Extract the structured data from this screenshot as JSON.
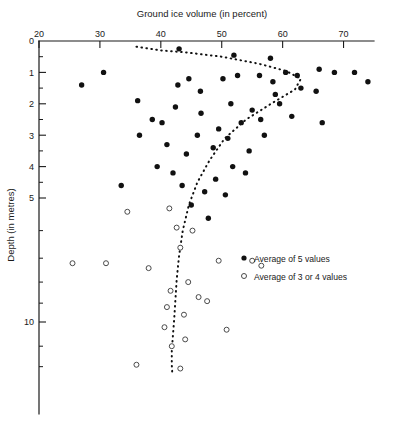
{
  "chart_data": {
    "type": "scatter",
    "title": "Ground ice volume (in percent)",
    "xlabel": "Ground ice volume (in percent)",
    "ylabel": "Depth (in metres)",
    "xlim": [
      20,
      75
    ],
    "ylim": [
      0,
      16
    ],
    "yscale": "log-like-depth",
    "grid": false,
    "xticks": [
      20,
      30,
      40,
      50,
      60,
      70
    ],
    "xtick_labels": [
      "20",
      "30",
      "40",
      "50",
      "60",
      "70"
    ],
    "yticks": [
      0,
      1,
      2,
      3,
      4,
      5,
      10
    ],
    "ytick_labels": [
      "0",
      "1",
      "2",
      "3",
      "4",
      "5",
      "10"
    ],
    "yticks_minor": [
      0.5,
      1.5,
      2.5,
      3.5,
      4.5,
      6,
      7,
      8,
      9,
      12,
      14
    ],
    "legend_position": "center-right",
    "series": [
      {
        "name": "Average of 5 values",
        "marker": "filled-circle",
        "color": "#111111",
        "points": [
          [
            27.0,
            1.4
          ],
          [
            30.6,
            1.0
          ],
          [
            36.2,
            1.9
          ],
          [
            38.6,
            2.5
          ],
          [
            36.5,
            3.0
          ],
          [
            42.8,
            1.4
          ],
          [
            46.5,
            1.6
          ],
          [
            46.6,
            2.3
          ],
          [
            46.0,
            3.0
          ],
          [
            44.2,
            3.6
          ],
          [
            42.0,
            4.2
          ],
          [
            33.5,
            4.6
          ],
          [
            50.2,
            1.2
          ],
          [
            51.5,
            2.0
          ],
          [
            52.6,
            1.1
          ],
          [
            56.2,
            1.1
          ],
          [
            58.4,
            1.3
          ],
          [
            58.8,
            1.7
          ],
          [
            55.0,
            2.2
          ],
          [
            53.2,
            2.6
          ],
          [
            56.4,
            2.5
          ],
          [
            51.0,
            3.1
          ],
          [
            48.6,
            3.4
          ],
          [
            54.5,
            3.5
          ],
          [
            51.8,
            4.0
          ],
          [
            49.0,
            4.4
          ],
          [
            47.2,
            4.8
          ],
          [
            50.6,
            4.9
          ],
          [
            60.5,
            1.0
          ],
          [
            62.4,
            1.1
          ],
          [
            66.0,
            0.9
          ],
          [
            68.5,
            1.0
          ],
          [
            71.8,
            1.0
          ],
          [
            74.0,
            1.3
          ],
          [
            63.0,
            1.5
          ],
          [
            65.5,
            1.6
          ],
          [
            44.6,
            1.2
          ],
          [
            40.2,
            2.6
          ],
          [
            41.0,
            3.3
          ],
          [
            39.4,
            4.0
          ],
          [
            43.5,
            4.6
          ],
          [
            45.0,
            5.2
          ],
          [
            47.8,
            5.6
          ],
          [
            42.4,
            2.1
          ],
          [
            49.5,
            2.8
          ],
          [
            53.9,
            4.2
          ],
          [
            57.0,
            3.0
          ],
          [
            59.5,
            2.0
          ],
          [
            61.5,
            2.4
          ],
          [
            43.0,
            0.25
          ],
          [
            52.0,
            0.45
          ],
          [
            58.0,
            0.55
          ],
          [
            66.5,
            2.6
          ]
        ]
      },
      {
        "name": "Average of 3 or 4 values",
        "marker": "open-circle",
        "color": "#4a4a4a",
        "points": [
          [
            41.4,
            5.3
          ],
          [
            42.6,
            5.9
          ],
          [
            45.2,
            6.0
          ],
          [
            34.5,
            5.4
          ],
          [
            25.5,
            7.2
          ],
          [
            31.0,
            7.2
          ],
          [
            38.0,
            7.4
          ],
          [
            43.2,
            6.6
          ],
          [
            49.5,
            7.1
          ],
          [
            55.0,
            7.1
          ],
          [
            44.5,
            8.0
          ],
          [
            41.6,
            8.4
          ],
          [
            46.2,
            8.7
          ],
          [
            47.6,
            8.9
          ],
          [
            41.0,
            9.2
          ],
          [
            43.8,
            9.6
          ],
          [
            40.6,
            10.4
          ],
          [
            50.8,
            10.6
          ],
          [
            44.0,
            11.4
          ],
          [
            41.8,
            12.0
          ],
          [
            36.0,
            13.8
          ],
          [
            43.2,
            14.2
          ],
          [
            56.5,
            7.3
          ]
        ]
      }
    ],
    "trend_line": {
      "style": "dotted",
      "description": "Dotted envelope curve rising from upper-left, reaching maximum ground ice volume near 63 percent at about 1.2 m depth, then decreasing with depth and becoming nearly vertical near 42 percent below 6 m.",
      "points": [
        [
          36.0,
          0.18
        ],
        [
          40.0,
          0.3
        ],
        [
          44.0,
          0.36
        ],
        [
          50.0,
          0.5
        ],
        [
          56.0,
          0.72
        ],
        [
          60.5,
          0.95
        ],
        [
          63.0,
          1.2
        ],
        [
          62.0,
          1.55
        ],
        [
          58.5,
          1.95
        ],
        [
          54.0,
          2.5
        ],
        [
          50.5,
          3.1
        ],
        [
          48.0,
          3.8
        ],
        [
          46.0,
          4.5
        ],
        [
          44.6,
          5.2
        ],
        [
          43.6,
          6.0
        ],
        [
          43.0,
          6.9
        ],
        [
          42.6,
          7.9
        ],
        [
          42.4,
          8.8
        ],
        [
          42.2,
          9.8
        ],
        [
          42.0,
          11.0
        ],
        [
          41.8,
          12.4
        ],
        [
          41.8,
          13.8
        ],
        [
          41.9,
          15.0
        ]
      ]
    }
  },
  "legend": {
    "entries": [
      {
        "marker": "filled-circle",
        "label": "Average of 5 values"
      },
      {
        "marker": "open-circle",
        "label": "Average of 3 or 4 values"
      }
    ]
  }
}
